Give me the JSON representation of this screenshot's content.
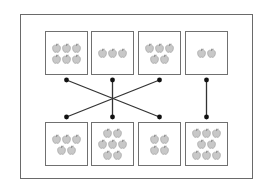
{
  "diagram": {
    "type": "matching",
    "colors": {
      "frame": "#6a6a6a",
      "box": "#707070",
      "apple": "#c8c8c8",
      "apple_outline": "#9a9a9a",
      "line": "#333333",
      "dot": "#111111"
    },
    "top_boxes": [
      {
        "index": 0,
        "apple_count": 6,
        "rows": [
          3,
          3
        ]
      },
      {
        "index": 1,
        "apple_count": 3,
        "rows": [
          3
        ]
      },
      {
        "index": 2,
        "apple_count": 5,
        "rows": [
          3,
          2
        ]
      },
      {
        "index": 3,
        "apple_count": 2,
        "rows": [
          2
        ]
      }
    ],
    "bottom_boxes": [
      {
        "index": 0,
        "apple_count": 5,
        "rows": [
          3,
          2
        ]
      },
      {
        "index": 1,
        "apple_count": 7,
        "rows": [
          2,
          3,
          2
        ]
      },
      {
        "index": 2,
        "apple_count": 4,
        "rows": [
          2,
          2
        ]
      },
      {
        "index": 3,
        "apple_count": 8,
        "rows": [
          3,
          2,
          3
        ]
      }
    ],
    "connections": [
      {
        "top": 0,
        "bottom": 2
      },
      {
        "top": 1,
        "bottom": 1
      },
      {
        "top": 2,
        "bottom": 0
      },
      {
        "top": 3,
        "bottom": 3
      }
    ]
  }
}
